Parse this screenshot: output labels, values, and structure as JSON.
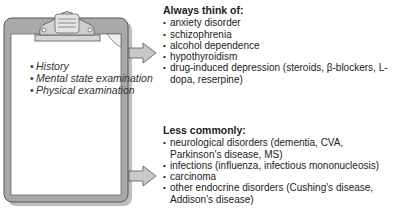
{
  "clipboard": {
    "items": [
      "History",
      "Mental state examination",
      "Physical examination"
    ]
  },
  "always": {
    "title": "Always think of:",
    "items": [
      "anxiety disorder",
      "schizophrenia",
      "alcohol dependence",
      "hypothyroidism",
      "drug-induced depression (steroids, β-blockers, L-dopa, reserpine)"
    ]
  },
  "less": {
    "title": "Less commonly:",
    "items": [
      "neurological disorders (dementia, CVA, Parkinson's disease, MS)",
      "infections (influenza, infectious mononucleosis)",
      "carcinoma",
      "other endocrine disorders (Cushing's disease, Addison's disease)"
    ]
  }
}
